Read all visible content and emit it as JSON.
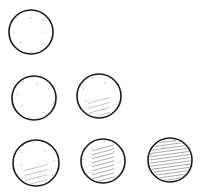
{
  "diagram": {
    "background": "#ffffff",
    "stroke_color": "#1a1a1a",
    "hatch_color": "#6a6a6a",
    "circles": [
      {
        "row": 1,
        "col": 1,
        "cx": 31,
        "cy": 32,
        "r": 22,
        "shading": 0
      },
      {
        "row": 2,
        "col": 1,
        "cx": 34,
        "cy": 98,
        "r": 22,
        "shading": 0
      },
      {
        "row": 2,
        "col": 2,
        "cx": 99,
        "cy": 96,
        "r": 22,
        "shading": 1
      },
      {
        "row": 3,
        "col": 1,
        "cx": 36,
        "cy": 163,
        "r": 23,
        "shading": 1
      },
      {
        "row": 3,
        "col": 2,
        "cx": 103,
        "cy": 161,
        "r": 22,
        "shading": 2
      },
      {
        "row": 3,
        "col": 3,
        "cx": 170,
        "cy": 160,
        "r": 22,
        "shading": 3
      }
    ]
  }
}
